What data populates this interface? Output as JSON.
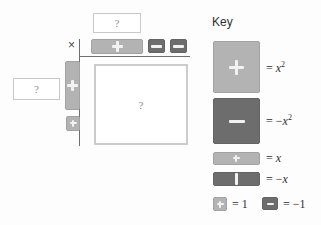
{
  "diagram": {
    "type": "algebra-tiles-area-model",
    "times_symbol": "×",
    "unknown_marker": "?",
    "top_factor_box": {
      "value": "?"
    },
    "left_factor_box": {
      "value": "?"
    },
    "product_box": {
      "value": "?"
    },
    "top_row_tiles": [
      {
        "name": "x-tile",
        "sign": "+",
        "glyph": "plus",
        "kind": "x",
        "orientation": "horizontal"
      },
      {
        "name": "unit-tile",
        "sign": "−",
        "glyph": "minus",
        "kind": "unit"
      },
      {
        "name": "unit-tile",
        "sign": "−",
        "glyph": "minus",
        "kind": "unit"
      }
    ],
    "left_column_tiles": [
      {
        "name": "x-tile",
        "sign": "+",
        "glyph": "plus",
        "kind": "x",
        "orientation": "vertical"
      },
      {
        "name": "unit-tile",
        "sign": "+",
        "glyph": "plus",
        "kind": "unit"
      }
    ]
  },
  "key": {
    "title": "Key",
    "entries": [
      {
        "tile": "x-squared-positive",
        "sign": "+",
        "glyph": "plus",
        "equals": "=",
        "value_text": "x²",
        "value_base": "x",
        "value_exp": "2",
        "negative": false
      },
      {
        "tile": "x-squared-negative",
        "sign": "−",
        "glyph": "minus",
        "equals": "=",
        "value_text": "−x²",
        "value_base": "x",
        "value_exp": "2",
        "negative": true
      },
      {
        "tile": "x-positive",
        "sign": "+",
        "glyph": "plus",
        "equals": "=",
        "value_text": "x",
        "value_base": "x",
        "value_exp": "",
        "negative": false
      },
      {
        "tile": "x-negative",
        "sign": "|",
        "glyph": "bar",
        "equals": "=",
        "value_text": "−x",
        "value_base": "x",
        "value_exp": "",
        "negative": true
      }
    ],
    "unit_row": {
      "positive": {
        "tile": "unit-positive",
        "sign": "+",
        "glyph": "plus",
        "equals": "=",
        "value_text": "1"
      },
      "negative": {
        "tile": "unit-negative",
        "sign": "−",
        "glyph": "minus",
        "equals": "=",
        "value_text": "−1"
      }
    }
  },
  "colors": {
    "positive_tile": "#b3b3b3",
    "negative_tile": "#6d6d6d",
    "tile_glyph": "#f2f2f2",
    "rule_line": "#6f6f6f",
    "box_border": "#c9c9c9",
    "text": "#2f2f2f",
    "background": "#fdfdfd"
  }
}
